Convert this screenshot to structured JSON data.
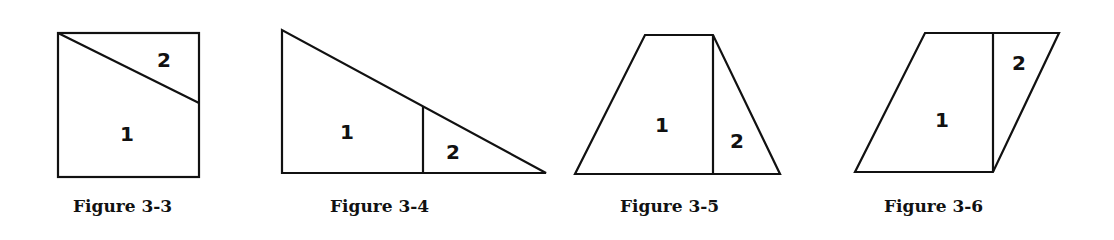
{
  "figures": [
    {
      "caption": "Figure 3-3",
      "shape": "square divided by a diagonal from the top-left corner to a point on the right side",
      "regions": [
        {
          "label": "1"
        },
        {
          "label": "2"
        }
      ]
    },
    {
      "caption": "Figure 3-4",
      "shape": "right triangle divided by a vertical segment into a trapezoid and a smaller triangle",
      "regions": [
        {
          "label": "1"
        },
        {
          "label": "2"
        }
      ]
    },
    {
      "caption": "Figure 3-5",
      "shape": "trapezoid divided by a vertical segment from the top-right vertex to the base",
      "regions": [
        {
          "label": "1"
        },
        {
          "label": "2"
        }
      ]
    },
    {
      "caption": "Figure 3-6",
      "shape": "parallelogram divided by a vertical segment from the top edge to the bottom-right vertex",
      "regions": [
        {
          "label": "1"
        },
        {
          "label": "2"
        }
      ]
    }
  ]
}
